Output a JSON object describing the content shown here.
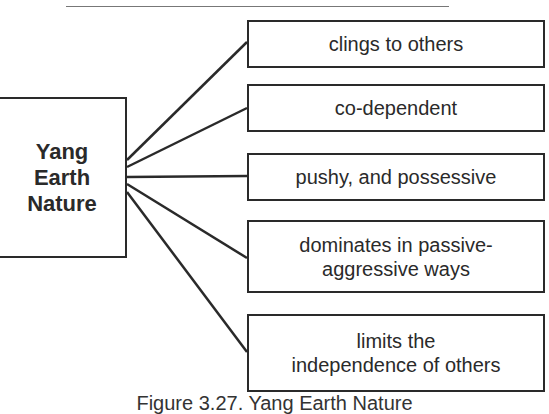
{
  "diagram": {
    "center": {
      "label": "Yang Earth Nature",
      "lines": [
        "Yang",
        "Earth",
        "Nature"
      ]
    },
    "traits": [
      {
        "label": "clings to others"
      },
      {
        "label": "co-dependent"
      },
      {
        "label": "pushy, and possessive"
      },
      {
        "label": "dominates in passive-aggressive ways",
        "lines": [
          "dominates in passive-",
          "aggressive ways"
        ]
      },
      {
        "label": "limits the independence of others",
        "lines": [
          "limits the",
          "independence of others"
        ]
      }
    ],
    "caption": "Figure 3.27. Yang Earth Nature",
    "colors": {
      "line": "#2a2a2a",
      "background": "#ffffff"
    }
  }
}
